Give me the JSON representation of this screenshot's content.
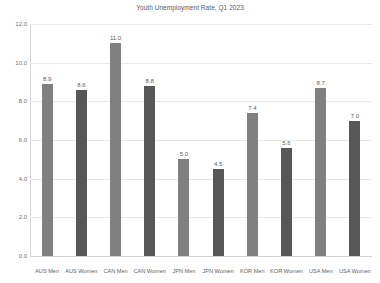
{
  "chart_data": {
    "type": "bar",
    "title": "Youth Unemployment Rate, Q1 2023",
    "xlabel": "",
    "ylabel": "",
    "ylim": [
      0.0,
      12.0
    ],
    "ytick_step": 2.0,
    "ytick_labels": [
      "12.0",
      "10.0",
      "8.0",
      "6.0",
      "4.0",
      "2.0",
      "0.0"
    ],
    "ytick_values": [
      12.0,
      10.0,
      8.0,
      6.0,
      4.0,
      2.0,
      0.0
    ],
    "grid": true,
    "legend": false,
    "categories": [
      "AUS Men",
      "AUS Women",
      "CAN Men",
      "CAN Women",
      "JPN Men",
      "JPN Women",
      "KOR Men",
      "KOR Women",
      "USA Men",
      "USA Women"
    ],
    "values": [
      8.9,
      8.6,
      11.0,
      8.8,
      5.0,
      4.5,
      7.4,
      5.6,
      8.7,
      7.0
    ],
    "data_labels": [
      "8.9",
      "8.6",
      "11.0",
      "8.8",
      "5.0",
      "4.5",
      "7.4",
      "5.6",
      "8.7",
      "7.0"
    ],
    "bar_groups": [
      "men",
      "women",
      "men",
      "women",
      "men",
      "women",
      "men",
      "women",
      "men",
      "women"
    ],
    "colors": {
      "men_bar": "#808080",
      "women_bar": "#575757",
      "gridline": "#e8e8e8",
      "axis": "#d9d9d9",
      "text": "#595959",
      "background": "#ffffff"
    }
  }
}
